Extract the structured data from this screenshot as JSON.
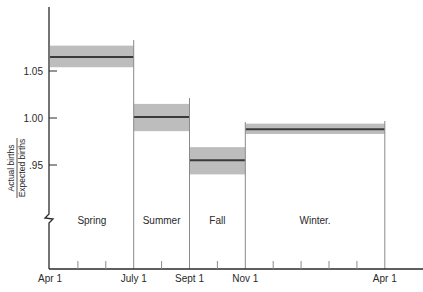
{
  "chart_data": {
    "type": "bar",
    "subtype": "range-band step chart",
    "title": "",
    "ylabel": {
      "numerator": "Actual births",
      "denominator": "Expected births"
    },
    "xlabel": "",
    "ylim": [
      0.9,
      1.105
    ],
    "y_axis_break": true,
    "grid": false,
    "yticks": [
      {
        "value": 1.05,
        "label": "1.05"
      },
      {
        "value": 1.0,
        "label": "1.00"
      },
      {
        "value": 0.95,
        "label": ".95"
      }
    ],
    "xticks": [
      {
        "label": "Apr 1",
        "month_index": 0
      },
      {
        "label": "July 1",
        "month_index": 3
      },
      {
        "label": "Sept 1",
        "month_index": 5
      },
      {
        "label": "Nov 1",
        "month_index": 7
      },
      {
        "label": "Apr 1",
        "month_index": 12
      }
    ],
    "minor_month_ticks": [
      1,
      2,
      4,
      6,
      8,
      9,
      10,
      11
    ],
    "categories": [
      "Spring",
      "Summer",
      "Fall",
      "Winter"
    ],
    "series": [
      {
        "name": "Ratio of actual to expected births",
        "values": [
          1.065,
          1.001,
          0.955,
          0.988
        ],
        "lower": [
          1.054,
          0.986,
          0.94,
          0.983
        ],
        "upper": [
          1.077,
          1.015,
          0.969,
          0.994
        ],
        "start_month": [
          0,
          3,
          5,
          7
        ],
        "end_month": [
          3,
          5,
          7,
          12
        ]
      }
    ],
    "season_labels": [
      "Spring",
      "Summer",
      "Fall",
      "Winter."
    ],
    "colors": {
      "band": "#bdbdbd",
      "mean_line": "#3a3a3a",
      "axis": "#2a2a2a",
      "divider": "#8a8a8a"
    }
  }
}
